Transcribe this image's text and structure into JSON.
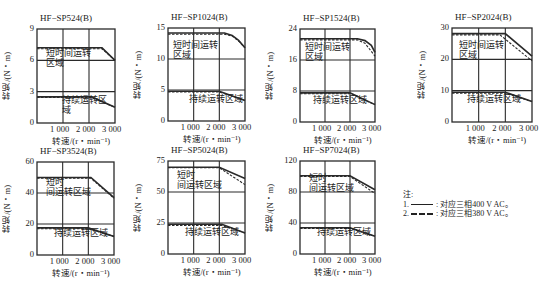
{
  "chart_data": [
    {
      "type": "line",
      "title": "HF−SP524(B)",
      "xlabel": "转速/(r・min⁻¹)",
      "ylabel": "转矩/(N・m)",
      "xlim": [
        0,
        3000
      ],
      "ylim": [
        0,
        9
      ],
      "xticks": [
        "1 000",
        "2 000",
        "3 000"
      ],
      "yticks": [
        "0",
        "3",
        "6",
        "9"
      ],
      "grid": true,
      "regions": {
        "short_term": "短时间运转区域",
        "continuous": "持续运转区域"
      },
      "series": [
        {
          "name": "短时间运转 400V",
          "style": "solid",
          "x": [
            0,
            2500,
            3000
          ],
          "y": [
            7.2,
            7.2,
            6.0
          ]
        },
        {
          "name": "短时间运转 380V",
          "style": "dashed",
          "x": [
            0,
            2500,
            3000
          ],
          "y": [
            7.1,
            7.1,
            6.0
          ]
        },
        {
          "name": "持续运转 400V",
          "style": "solid",
          "x": [
            0,
            2100,
            3000
          ],
          "y": [
            2.5,
            2.5,
            1.5
          ]
        },
        {
          "name": "持续运转 380V",
          "style": "dashed",
          "x": [
            0,
            2100,
            3000
          ],
          "y": [
            2.45,
            2.45,
            1.5
          ]
        }
      ]
    },
    {
      "type": "line",
      "title": "HF−SP1024(B)",
      "xlabel": "转速/(r・min⁻¹)",
      "ylabel": "转矩/(N・m)",
      "xlim": [
        0,
        3000
      ],
      "ylim": [
        0,
        15
      ],
      "xticks": [
        "1 000",
        "2 000",
        "3 000"
      ],
      "yticks": [
        "0",
        "5",
        "10",
        "15"
      ],
      "grid": true,
      "regions": {
        "short_term": "短时间运转区域",
        "continuous": "持续运转区域"
      },
      "series": [
        {
          "name": "短时间运转 400V",
          "style": "solid",
          "x": [
            0,
            2200,
            2500,
            2750,
            3000
          ],
          "y": [
            14.2,
            14.2,
            13.8,
            13.0,
            11.8
          ]
        },
        {
          "name": "短时间运转 380V",
          "style": "dashed",
          "x": [
            0,
            2200,
            2500,
            2750,
            3000
          ],
          "y": [
            14.0,
            14.0,
            13.7,
            12.9,
            11.8
          ]
        },
        {
          "name": "持续运转 400V",
          "style": "solid",
          "x": [
            0,
            2000,
            3000
          ],
          "y": [
            4.8,
            4.8,
            3.3
          ]
        },
        {
          "name": "持续运转 380V",
          "style": "dashed",
          "x": [
            0,
            2000,
            3000
          ],
          "y": [
            4.7,
            4.7,
            3.3
          ]
        }
      ]
    },
    {
      "type": "line",
      "title": "HF−SP1524(B)",
      "xlabel": "转速/(r・min⁻¹)",
      "ylabel": "转矩/(N・m)",
      "xlim": [
        0,
        3000
      ],
      "ylim": [
        0,
        24
      ],
      "xticks": [
        "1 000",
        "2 000",
        "3 000"
      ],
      "yticks": [
        "0",
        "8",
        "16",
        "24"
      ],
      "grid": true,
      "regions": {
        "short_term": "短时间运转区域",
        "continuous": "持续运转区域"
      },
      "series": [
        {
          "name": "短时间运转 400V",
          "style": "solid",
          "x": [
            0,
            2300,
            2600,
            2850,
            3000
          ],
          "y": [
            21.5,
            21.5,
            21.0,
            19.8,
            18.0
          ]
        },
        {
          "name": "短时间运转 380V",
          "style": "dashed",
          "x": [
            0,
            2300,
            2600,
            3000
          ],
          "y": [
            21.2,
            21.2,
            20.3,
            17.0
          ]
        },
        {
          "name": "持续运转 400V",
          "style": "solid",
          "x": [
            0,
            2000,
            3000
          ],
          "y": [
            7.5,
            7.5,
            4.5
          ]
        },
        {
          "name": "持续运转 380V",
          "style": "dashed",
          "x": [
            0,
            2000,
            3000
          ],
          "y": [
            7.3,
            7.3,
            4.5
          ]
        }
      ]
    },
    {
      "type": "line",
      "title": "HF−SP2024(B)",
      "xlabel": "转速/(r・min⁻¹)",
      "ylabel": "转矩/(N・m)",
      "xlim": [
        0,
        3000
      ],
      "ylim": [
        0,
        30
      ],
      "xticks": [
        "1 000",
        "2 000",
        "3 000"
      ],
      "yticks": [
        "0",
        "10",
        "20",
        "30"
      ],
      "grid": true,
      "regions": {
        "short_term": "短时间运转区域",
        "continuous": "持续运转区域"
      },
      "series": [
        {
          "name": "短时间运转 400V",
          "style": "solid",
          "x": [
            0,
            2000,
            3000
          ],
          "y": [
            28.2,
            28.2,
            21.0
          ]
        },
        {
          "name": "短时间运转 380V",
          "style": "dashed",
          "x": [
            0,
            1800,
            3000
          ],
          "y": [
            27.8,
            27.8,
            19.5
          ]
        },
        {
          "name": "持续运转 400V",
          "style": "solid",
          "x": [
            0,
            2000,
            3000
          ],
          "y": [
            9.5,
            9.5,
            6.5
          ]
        },
        {
          "name": "持续运转 380V",
          "style": "dashed",
          "x": [
            0,
            2000,
            3000
          ],
          "y": [
            9.2,
            9.2,
            6.5
          ]
        }
      ]
    },
    {
      "type": "line",
      "title": "HF−SP3524(B)",
      "xlabel": "转速/(r・min⁻¹)",
      "ylabel": "转矩/(N・m)",
      "xlim": [
        0,
        3000
      ],
      "ylim": [
        0,
        60
      ],
      "xticks": [
        "1 000",
        "2 000",
        "3 000"
      ],
      "yticks": [
        "0",
        "20",
        "40",
        "60"
      ],
      "grid": true,
      "regions": {
        "short_term": "短时间运转区域",
        "continuous": "持续运转区域"
      },
      "series": [
        {
          "name": "短时间运转 400V",
          "style": "solid",
          "x": [
            0,
            2100,
            3000
          ],
          "y": [
            50.0,
            50.0,
            37.0
          ]
        },
        {
          "name": "短时间运转 380V",
          "style": "dashed",
          "x": [
            0,
            2100,
            3000
          ],
          "y": [
            49.5,
            49.5,
            36.5
          ]
        },
        {
          "name": "持续运转 400V",
          "style": "solid",
          "x": [
            0,
            2000,
            3000
          ],
          "y": [
            17.5,
            17.5,
            12.0
          ]
        },
        {
          "name": "持续运转 380V",
          "style": "dashed",
          "x": [
            0,
            2000,
            3000
          ],
          "y": [
            17.0,
            17.0,
            12.0
          ]
        }
      ]
    },
    {
      "type": "line",
      "title": "HF−SP5024(B)",
      "xlabel": "转速/(r・min⁻¹)",
      "ylabel": "转矩/(N・m)",
      "xlim": [
        0,
        3000
      ],
      "ylim": [
        0,
        75
      ],
      "xticks": [
        "1 000",
        "2 000",
        "3 000"
      ],
      "yticks": [
        "0",
        "25",
        "50",
        "75"
      ],
      "grid": true,
      "regions": {
        "short_term": "短时间运转区域",
        "continuous": "持续运转区域"
      },
      "series": [
        {
          "name": "短时间运转 400V",
          "style": "solid",
          "x": [
            0,
            2000,
            3000
          ],
          "y": [
            70.0,
            70.0,
            61.0
          ]
        },
        {
          "name": "短时间运转 380V",
          "style": "dashed",
          "x": [
            0,
            2000,
            3000
          ],
          "y": [
            69.5,
            69.5,
            56.0
          ]
        },
        {
          "name": "持续运转 400V",
          "style": "solid",
          "x": [
            0,
            2100,
            3000
          ],
          "y": [
            24.0,
            24.0,
            17.0
          ]
        },
        {
          "name": "持续运转 380V",
          "style": "dashed",
          "x": [
            0,
            2100,
            3000
          ],
          "y": [
            23.0,
            23.0,
            17.0
          ]
        }
      ]
    },
    {
      "type": "line",
      "title": "HF−SP7024(B)",
      "xlabel": "转速/(r・min⁻¹)",
      "ylabel": "转矩/(N・m)",
      "xlim": [
        0,
        3000
      ],
      "ylim": [
        0,
        120
      ],
      "xticks": [
        "1 000",
        "2 000",
        "3 000"
      ],
      "yticks": [
        "0",
        "40",
        "80",
        "120"
      ],
      "grid": true,
      "regions": {
        "short_term": "短时间运转区域",
        "continuous": "持续运转区域"
      },
      "series": [
        {
          "name": "短时间运转 400V",
          "style": "solid",
          "x": [
            0,
            2000,
            3000
          ],
          "y": [
            101.0,
            101.0,
            83.0
          ]
        },
        {
          "name": "短时间运转 380V",
          "style": "dashed",
          "x": [
            0,
            2000,
            3000
          ],
          "y": [
            100.0,
            100.0,
            78.0
          ]
        },
        {
          "name": "持续运转 400V",
          "style": "solid",
          "x": [
            0,
            2000,
            3000
          ],
          "y": [
            34.0,
            34.0,
            23.0
          ]
        },
        {
          "name": "持续运转 380V",
          "style": "dashed",
          "x": [
            0,
            2000,
            3000
          ],
          "y": [
            33.0,
            33.0,
            23.0
          ]
        }
      ]
    }
  ],
  "layout": {
    "frames": [
      {
        "left": 37,
        "top": 29,
        "width": 78,
        "height": 94,
        "short_label_lines": [
          "短时间运转",
          "区域"
        ],
        "short_label_pos": [
          8,
          19
        ],
        "cont_label_pos": [
          24,
          66
        ]
      },
      {
        "left": 168,
        "top": 28,
        "width": 77,
        "height": 93,
        "short_label_lines": [
          "短时间运转",
          "区域"
        ],
        "short_label_pos": [
          4,
          12
        ],
        "cont_label_pos": [
          20,
          66
        ]
      },
      {
        "left": 300,
        "top": 29,
        "width": 75,
        "height": 93,
        "short_label_lines": [
          "短时间运转",
          "区域"
        ],
        "short_label_pos": [
          4,
          13
        ],
        "cont_label_pos": [
          12,
          66
        ]
      },
      {
        "left": 452,
        "top": 28,
        "width": 80,
        "height": 94,
        "short_label_lines": [
          "短时间运转",
          "区域"
        ],
        "short_label_pos": [
          6,
          12
        ],
        "cont_label_pos": [
          14,
          66
        ]
      },
      {
        "left": 37,
        "top": 162,
        "width": 77,
        "height": 93,
        "short_label_lines": [
          "短时",
          "间运转区域"
        ],
        "short_label_pos": [
          8,
          15
        ],
        "cont_label_pos": [
          16,
          66
        ]
      },
      {
        "left": 168,
        "top": 161,
        "width": 77,
        "height": 93,
        "short_label_lines": [
          "短时",
          "间运转区域"
        ],
        "short_label_pos": [
          8,
          9
        ],
        "cont_label_pos": [
          16,
          66
        ]
      },
      {
        "left": 300,
        "top": 161,
        "width": 75,
        "height": 93,
        "short_label_lines": [
          "短时",
          "间运转区域"
        ],
        "short_label_pos": [
          8,
          12
        ],
        "cont_label_pos": [
          16,
          66
        ]
      }
    ]
  },
  "legend": {
    "title": "注:",
    "items": [
      {
        "index": "1.",
        "style": "solid",
        "text": ": 对应三相400 V AC。"
      },
      {
        "index": "2.",
        "style": "dashed",
        "text": ": 对应三相380 V AC。"
      }
    ]
  },
  "colors": {
    "line": "#2a2a2a",
    "grid": "#2a2a2a",
    "background": "#ffffff"
  }
}
